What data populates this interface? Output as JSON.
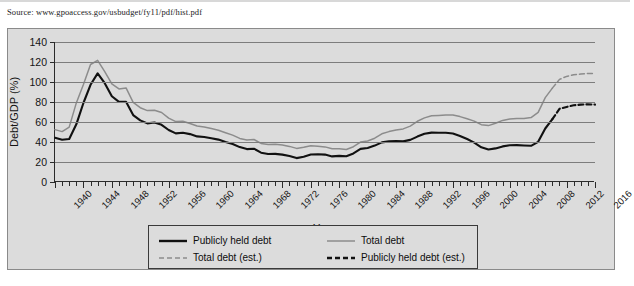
{
  "source_note": "Source: www.gpoaccess.gov/usbudget/fy11/pdf/hist.pdf",
  "colors": {
    "panel_background": "#dcdcdc",
    "panel_border": "#8a8a8a",
    "axis": "#2b2b2b",
    "gridline": "#7d7d7d",
    "publicly_held": "#111111",
    "total_debt": "#8c8c8c",
    "text": "#141414"
  },
  "chart_data": {
    "type": "line",
    "title": "",
    "xlabel": "Year",
    "ylabel": "Debt/GDP (%)",
    "xlim": [
      1940,
      2016
    ],
    "ylim": [
      0,
      140
    ],
    "ytick_values": [
      0,
      20,
      40,
      60,
      80,
      100,
      120,
      140
    ],
    "xtick_major": [
      1940,
      1944,
      1948,
      1952,
      1956,
      1960,
      1964,
      1968,
      1972,
      1976,
      1980,
      1984,
      1988,
      1992,
      1996,
      2000,
      2004,
      2008,
      2012,
      2016
    ],
    "xtick_minor_step": 1,
    "grid": "horizontal",
    "legend_position": "below-plot",
    "series": [
      {
        "name": "Publicly held debt",
        "style": "solid",
        "color": "#111111",
        "width": 2.1,
        "x": [
          1940,
          1941,
          1942,
          1943,
          1944,
          1945,
          1946,
          1947,
          1948,
          1949,
          1950,
          1951,
          1952,
          1953,
          1954,
          1955,
          1956,
          1957,
          1958,
          1959,
          1960,
          1961,
          1962,
          1963,
          1964,
          1965,
          1966,
          1967,
          1968,
          1969,
          1970,
          1971,
          1972,
          1973,
          1974,
          1975,
          1976,
          1977,
          1978,
          1979,
          1980,
          1981,
          1982,
          1983,
          1984,
          1985,
          1986,
          1987,
          1988,
          1989,
          1990,
          1991,
          1992,
          1993,
          1994,
          1995,
          1996,
          1997,
          1998,
          1999,
          2000,
          2001,
          2002,
          2003,
          2004,
          2005,
          2006,
          2007,
          2008,
          2009,
          2010
        ],
        "values": [
          44.2,
          42.3,
          43.0,
          57.7,
          79.0,
          97.2,
          108.6,
          98.8,
          85.7,
          80.1,
          80.2,
          66.9,
          61.6,
          58.6,
          59.5,
          57.2,
          52.0,
          48.6,
          49.2,
          47.9,
          45.6,
          45.0,
          43.7,
          42.4,
          40.0,
          38.0,
          34.9,
          32.9,
          33.3,
          29.3,
          28.0,
          28.1,
          27.4,
          26.0,
          23.9,
          25.3,
          27.5,
          27.8,
          27.4,
          25.6,
          26.1,
          25.8,
          28.6,
          33.1,
          34.0,
          36.4,
          39.6,
          40.6,
          40.9,
          40.6,
          42.1,
          45.4,
          48.2,
          49.4,
          49.3,
          49.2,
          48.5,
          46.0,
          43.0,
          39.4,
          34.7,
          32.5,
          33.6,
          35.6,
          36.8,
          36.9,
          36.5,
          36.2,
          40.2,
          53.5,
          62.8
        ]
      },
      {
        "name": "Total debt",
        "style": "solid",
        "color": "#8c8c8c",
        "width": 1.5,
        "x": [
          1940,
          1941,
          1942,
          1943,
          1944,
          1945,
          1946,
          1947,
          1948,
          1949,
          1950,
          1951,
          1952,
          1953,
          1954,
          1955,
          1956,
          1957,
          1958,
          1959,
          1960,
          1961,
          1962,
          1963,
          1964,
          1965,
          1966,
          1967,
          1968,
          1969,
          1970,
          1971,
          1972,
          1973,
          1974,
          1975,
          1976,
          1977,
          1978,
          1979,
          1980,
          1981,
          1982,
          1983,
          1984,
          1985,
          1986,
          1987,
          1988,
          1989,
          1990,
          1991,
          1992,
          1993,
          1994,
          1995,
          1996,
          1997,
          1998,
          1999,
          2000,
          2001,
          2002,
          2003,
          2004,
          2005,
          2006,
          2007,
          2008,
          2009,
          2010
        ],
        "values": [
          52.4,
          50.4,
          54.9,
          79.1,
          97.6,
          117.5,
          121.7,
          110.3,
          98.2,
          93.1,
          94.1,
          79.6,
          74.3,
          71.4,
          71.8,
          69.5,
          63.9,
          60.4,
          60.8,
          58.5,
          56.0,
          55.1,
          53.4,
          51.8,
          49.3,
          46.9,
          43.6,
          41.9,
          42.5,
          38.6,
          37.6,
          37.8,
          37.0,
          35.6,
          33.6,
          34.7,
          36.2,
          35.8,
          35.1,
          33.2,
          33.3,
          32.5,
          35.3,
          39.9,
          41.0,
          43.8,
          48.2,
          50.4,
          51.9,
          53.1,
          55.9,
          60.7,
          64.1,
          66.2,
          66.6,
          67.0,
          67.1,
          65.4,
          63.2,
          60.9,
          57.3,
          56.4,
          58.8,
          61.6,
          62.9,
          63.5,
          63.5,
          64.4,
          69.7,
          84.4,
          93.9
        ]
      },
      {
        "name": "Publicly held debt (est.)",
        "style": "dashed",
        "color": "#111111",
        "width": 2.1,
        "x": [
          2010,
          2011,
          2012,
          2013,
          2014,
          2015,
          2016
        ],
        "values": [
          62.8,
          73.2,
          75.1,
          76.7,
          77.4,
          77.7,
          77.4
        ]
      },
      {
        "name": "Total debt (est.)",
        "style": "dashed",
        "color": "#8c8c8c",
        "width": 1.5,
        "x": [
          2010,
          2011,
          2012,
          2013,
          2014,
          2015,
          2016
        ],
        "values": [
          93.9,
          102.6,
          105.6,
          107.2,
          108.0,
          108.6,
          108.3
        ]
      }
    ]
  },
  "legend": {
    "entries": [
      {
        "label": "Publicly held debt",
        "style": "solid",
        "color": "#111111",
        "width": 2.4
      },
      {
        "label": "Total debt",
        "style": "solid",
        "color": "#8c8c8c",
        "width": 1.5
      },
      {
        "label": "Total debt (est.)",
        "style": "dashed",
        "color": "#8c8c8c",
        "width": 1.5
      },
      {
        "label": "Publicly held debt (est.)",
        "style": "dashed",
        "color": "#111111",
        "width": 2.4
      }
    ]
  }
}
